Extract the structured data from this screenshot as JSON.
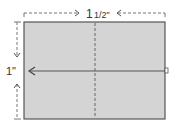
{
  "diagram": {
    "width_label": "1 1/2\"",
    "width_whole": "1",
    "width_fraction": "1/2\"",
    "height_label": "1\"",
    "colors": {
      "fill": "#d4d4d4",
      "stroke": "#555555",
      "dash": "#666666"
    }
  }
}
